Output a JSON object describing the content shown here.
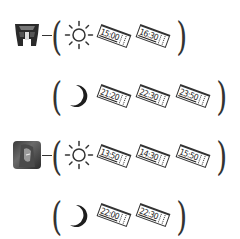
{
  "schedules": [
    {
      "character": "autobot-logo",
      "day": {
        "icon": "sun-icon",
        "times": [
          "15:00",
          "16:30"
        ]
      },
      "night": {
        "icon": "moon-icon",
        "times": [
          "21:20",
          "22:30",
          "23:50"
        ]
      }
    },
    {
      "character": "photo-avatar",
      "day": {
        "icon": "sun-icon",
        "times": [
          "13:50",
          "14:30",
          "15:50"
        ]
      },
      "night": {
        "icon": "moon-icon",
        "times": [
          "22:00",
          "22:30"
        ]
      }
    }
  ],
  "colors": {
    "ink": "#333333",
    "background": "#ffffff"
  }
}
